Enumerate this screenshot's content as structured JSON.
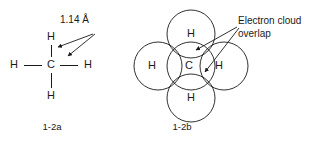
{
  "figure": {
    "ink_color": "#1a1a1a",
    "background_color": "#ffffff"
  },
  "left_panel": {
    "name": "lewis-structure-methane",
    "caption": "1-2a",
    "bond_length_label": "1.14 Å",
    "center_atom": "C",
    "hydrogens": [
      {
        "position": "top",
        "label": "H"
      },
      {
        "position": "left",
        "label": "H"
      },
      {
        "position": "right",
        "label": "H"
      },
      {
        "position": "bottom",
        "label": "H"
      }
    ],
    "annotation_arrow_count": 2
  },
  "right_panel": {
    "name": "electron-cloud-model-methane",
    "caption": "1-2b",
    "annotation_line_1": "Electron cloud",
    "annotation_line_2": "overlap",
    "center_atom": "C",
    "hydrogens": [
      {
        "position": "top",
        "label": "H"
      },
      {
        "position": "left",
        "label": "H"
      },
      {
        "position": "right",
        "label": "H"
      },
      {
        "position": "bottom",
        "label": "H"
      }
    ],
    "annotation_arrow_count": 2
  }
}
